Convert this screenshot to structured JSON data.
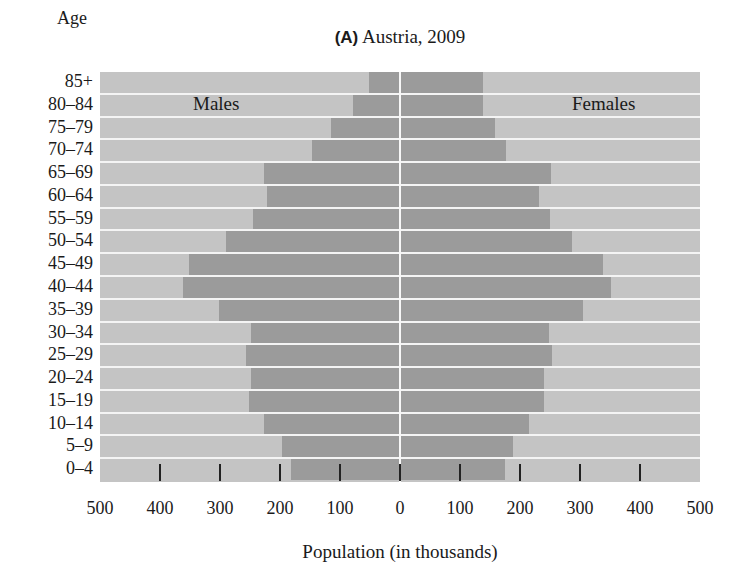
{
  "title": {
    "panel": "(A)",
    "text": "Austria, 2009"
  },
  "axes": {
    "y_header": "Age",
    "x_label": "Population (in thousands)",
    "x_ticks": [
      "500",
      "400",
      "300",
      "200",
      "100",
      "0",
      "100",
      "200",
      "300",
      "400",
      "500"
    ]
  },
  "legend": {
    "left": "Males",
    "right": "Females"
  },
  "colors": {
    "bar": "#9b9b9b",
    "background": "#c4c4c4",
    "separator": "#f4f4f4",
    "tick": "#222222"
  },
  "chart_data": {
    "type": "bar",
    "subtype": "population-pyramid",
    "title": "(A) Austria, 2009",
    "xlabel": "Population (in thousands)",
    "ylabel": "Age",
    "xlim": [
      -500,
      500
    ],
    "x_tick_values": [
      -500,
      -400,
      -300,
      -200,
      -100,
      0,
      100,
      200,
      300,
      400,
      500
    ],
    "x_tick_labels": [
      "500",
      "400",
      "300",
      "200",
      "100",
      "0",
      "100",
      "200",
      "300",
      "400",
      "500"
    ],
    "grid": false,
    "legend_position": "inside-top (Males left, Females right)",
    "categories": [
      "85+",
      "80–84",
      "75–79",
      "70–74",
      "65–69",
      "60–64",
      "55–59",
      "50–54",
      "45–49",
      "40–44",
      "35–39",
      "30–34",
      "25–29",
      "20–24",
      "15–19",
      "10–14",
      "5–9",
      "0–4"
    ],
    "series": [
      {
        "name": "Males",
        "values": [
          52,
          78,
          115,
          147,
          227,
          222,
          245,
          290,
          352,
          362,
          302,
          249,
          257,
          248,
          252,
          227,
          197,
          182
        ]
      },
      {
        "name": "Females",
        "values": [
          138,
          138,
          158,
          177,
          252,
          232,
          250,
          287,
          338,
          352,
          305,
          248,
          253,
          240,
          240,
          215,
          188,
          175
        ]
      }
    ]
  }
}
